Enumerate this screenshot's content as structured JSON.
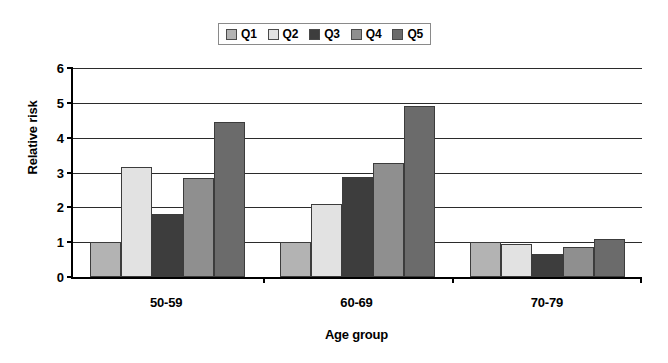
{
  "chart_data": {
    "type": "bar",
    "title": "",
    "xlabel": "Age group",
    "ylabel": "Relative risk",
    "categories": [
      "50-59",
      "60-69",
      "70-79"
    ],
    "series": [
      {
        "name": "Q1",
        "color": "#b3b3b3",
        "values": [
          1.0,
          1.0,
          1.0
        ]
      },
      {
        "name": "Q2",
        "color": "#e2e2e2",
        "values": [
          3.15,
          2.1,
          0.95
        ]
      },
      {
        "name": "Q3",
        "color": "#3d3d3d",
        "values": [
          1.82,
          2.87,
          0.66
        ]
      },
      {
        "name": "Q4",
        "color": "#8f8f8f",
        "values": [
          2.83,
          3.27,
          0.87
        ]
      },
      {
        "name": "Q5",
        "color": "#6b6b6b",
        "values": [
          4.45,
          4.9,
          1.08
        ]
      }
    ],
    "ylim": [
      0,
      6
    ],
    "yticks": [
      0,
      1,
      2,
      3,
      4,
      5,
      6
    ],
    "ytick_labels": [
      "0",
      "1",
      "2",
      "3",
      "4",
      "5",
      "6"
    ],
    "grid": true,
    "legend_position": "top-center",
    "legend_entries": [
      "Q1",
      "Q2",
      "Q3",
      "Q4",
      "Q5"
    ]
  },
  "colors": {
    "axis": "#000000",
    "gridline": "#2b2b2b",
    "background": "#ffffff",
    "bar_border": "#3c3c3c",
    "legend_border": "#8a8a8a"
  }
}
